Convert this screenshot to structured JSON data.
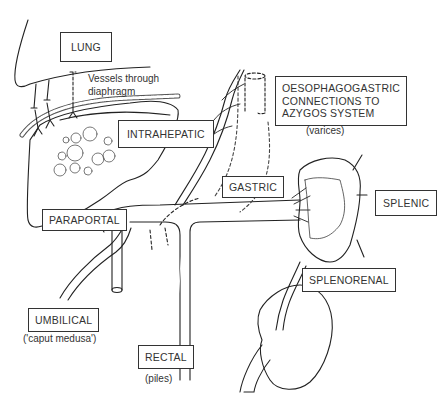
{
  "diagram": {
    "type": "anatomical-schematic",
    "labels": {
      "lung": "LUNG",
      "vessels_diaphragm": "Vessels through\ndiaphragm",
      "intrahepatic": "INTRAHEPATIC",
      "oesophagogastric": "OESOPHAGOGASTRIC\nCONNECTIONS TO\nAZYGOS SYSTEM",
      "varices": "(varices)",
      "gastric": "GASTRIC",
      "splenic": "SPLENIC",
      "paraportal": "PARAPORTAL",
      "splenorenal": "SPLENORENAL",
      "umbilical": "UMBILICAL",
      "caput_medusa": "('caput medusa')",
      "rectal": "RECTAL",
      "piles": "(piles)"
    },
    "colors": {
      "line": "#222222",
      "background": "#ffffff"
    }
  }
}
